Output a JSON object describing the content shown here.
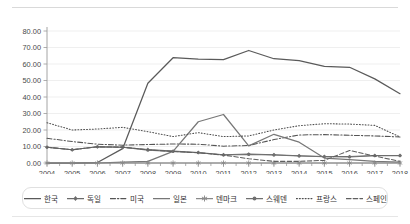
{
  "chart_data": {
    "type": "line",
    "title": "",
    "subtitle": "",
    "xlabel": "",
    "ylabel": "",
    "grid": true,
    "legend_position": "bottom",
    "ylim": [
      0,
      80
    ],
    "ytick_labels": [
      "0.00",
      "10.00",
      "20.00",
      "30.00",
      "40.00",
      "50.00",
      "60.00",
      "70.00",
      "80.00"
    ],
    "ytick_values": [
      0,
      10,
      20,
      30,
      40,
      50,
      60,
      70,
      80
    ],
    "categories": [
      "2004",
      "2005",
      "2006",
      "2007",
      "2008",
      "2009",
      "2010",
      "2011",
      "2012",
      "2013",
      "2014",
      "2015",
      "2016",
      "2017",
      "2018"
    ],
    "x": [
      2004,
      2005,
      2006,
      2007,
      2008,
      2009,
      2010,
      2011,
      2012,
      2013,
      2014,
      2015,
      2016,
      2017,
      2018
    ],
    "series": [
      {
        "name": "한국",
        "style": "solid",
        "marker": "none",
        "color": "#5a5a5a",
        "values": [
          0.0,
          0.0,
          0.3,
          8.7,
          48.3,
          63.8,
          63.0,
          62.6,
          68.2,
          63.2,
          62.0,
          58.6,
          58.0,
          51.0,
          42.0
        ]
      },
      {
        "name": "독일",
        "style": "solid",
        "marker": "diamond",
        "color": "#6b6b6b",
        "values": [
          9.6,
          8.0,
          9.8,
          9.6,
          8.2,
          7.2,
          6.4,
          5.0,
          5.4,
          5.0,
          4.4,
          4.0,
          3.9,
          4.6,
          4.6
        ]
      },
      {
        "name": "미국",
        "style": "dashdot",
        "marker": "none",
        "color": "#555555",
        "values": [
          15.0,
          13.0,
          11.4,
          10.8,
          11.2,
          11.5,
          11.4,
          10.2,
          10.6,
          14.2,
          17.0,
          17.2,
          16.8,
          16.4,
          15.8
        ]
      },
      {
        "name": "일본",
        "style": "solid",
        "marker": "none",
        "color": "#777777",
        "values": [
          0.0,
          0.0,
          0.0,
          0.5,
          1.0,
          7.0,
          25.0,
          29.4,
          10.4,
          17.4,
          12.6,
          3.0,
          2.0,
          1.0,
          0.6
        ]
      },
      {
        "name": "덴마크",
        "style": "solid",
        "marker": "asterisk",
        "color": "#8a8a8a",
        "values": [
          0.0,
          0.0,
          0.0,
          0.0,
          0.0,
          0.0,
          0.0,
          0.0,
          0.0,
          0.0,
          0.0,
          0.0,
          0.0,
          0.0,
          0.0
        ]
      },
      {
        "name": "스웨덴",
        "style": "solid",
        "marker": "dot",
        "color": "#707070",
        "values": [
          9.6,
          8.0,
          9.8,
          9.6,
          7.8,
          7.0,
          6.2,
          4.8,
          5.2,
          4.8,
          4.2,
          3.8,
          3.6,
          4.4,
          4.4
        ]
      },
      {
        "name": "프랑스",
        "style": "dotted",
        "marker": "none",
        "color": "#4f4f4f",
        "values": [
          24.4,
          20.0,
          20.6,
          21.6,
          19.0,
          16.0,
          18.4,
          16.0,
          16.4,
          20.0,
          22.6,
          23.8,
          23.6,
          22.8,
          15.8
        ]
      },
      {
        "name": "스페인",
        "style": "dashed",
        "marker": "none",
        "color": "#5f5f5f",
        "values": [
          9.6,
          8.0,
          9.8,
          9.6,
          8.0,
          7.0,
          6.2,
          4.8,
          2.6,
          1.0,
          1.0,
          1.6,
          7.6,
          4.2,
          1.0
        ]
      }
    ]
  },
  "legend": {
    "items": [
      {
        "label": "한국"
      },
      {
        "label": "독일"
      },
      {
        "label": "미국"
      },
      {
        "label": "일본"
      },
      {
        "label": "덴마크"
      },
      {
        "label": "스웨덴"
      },
      {
        "label": "프랑스"
      },
      {
        "label": "스페인"
      }
    ]
  }
}
